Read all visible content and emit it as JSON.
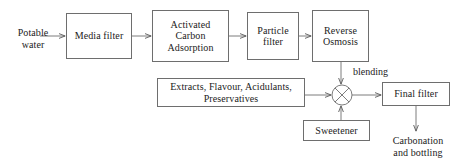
{
  "diagram": {
    "canvas": {
      "width": 460,
      "height": 168,
      "background": "#ffffff"
    },
    "style": {
      "line_color": "#6e6e6e",
      "text_color": "#1b1b1b",
      "box_fill": "#ffffff"
    },
    "nodes": [
      {
        "id": "potable_water",
        "label": "Potable\nwater",
        "label_line1": "Potable",
        "label_line2": "water",
        "shape": "text",
        "x": 6,
        "y": 27,
        "w": 54,
        "h": 26
      },
      {
        "id": "media_filter",
        "label": "Media filter",
        "shape": "rect",
        "x": 66,
        "y": 13,
        "w": 66,
        "h": 46
      },
      {
        "id": "activated_carbon",
        "label": "Activated\nCarbon\nAdsorption",
        "label_line1": "Activated",
        "label_line2": "Carbon",
        "label_line3": "Adsorption",
        "shape": "rect",
        "x": 152,
        "y": 10,
        "w": 77,
        "h": 52
      },
      {
        "id": "particle_filter",
        "label": "Particle\nfilter",
        "label_line1": "Particle",
        "label_line2": "filter",
        "shape": "rect",
        "x": 247,
        "y": 12,
        "w": 52,
        "h": 48
      },
      {
        "id": "reverse_osmosis",
        "label": "Reverse\nOsmosis",
        "label_line1": "Reverse",
        "label_line2": "Osmosis",
        "shape": "rect",
        "x": 312,
        "y": 10,
        "w": 57,
        "h": 52
      },
      {
        "id": "extracts",
        "label": "Extracts, Flavour, Acidulants,\nPreservatives",
        "label_line1": "Extracts, Flavour, Acidulants,",
        "label_line2": "Preservatives",
        "shape": "rect",
        "x": 157,
        "y": 78,
        "w": 148,
        "h": 29
      },
      {
        "id": "mixer",
        "label": "",
        "shape": "circle-cross",
        "cx": 342,
        "cy": 95,
        "r": 10
      },
      {
        "id": "sweetener",
        "label": "Sweetener",
        "shape": "rect",
        "x": 303,
        "y": 120,
        "w": 67,
        "h": 21
      },
      {
        "id": "final_filter",
        "label": "Final filter",
        "shape": "rect",
        "x": 382,
        "y": 82,
        "w": 68,
        "h": 24
      },
      {
        "id": "carbonation",
        "label": "Carbonation\nand bottling",
        "label_line1": "Carbonation",
        "label_line2": "and bottling",
        "shape": "text",
        "x": 382,
        "y": 135,
        "w": 72,
        "h": 26
      }
    ],
    "edges": [
      {
        "from": "potable_water",
        "to": "media_filter",
        "label": "",
        "direction": "right"
      },
      {
        "from": "media_filter",
        "to": "activated_carbon",
        "label": "",
        "direction": "right"
      },
      {
        "from": "activated_carbon",
        "to": "particle_filter",
        "label": "",
        "direction": "right"
      },
      {
        "from": "particle_filter",
        "to": "reverse_osmosis",
        "label": "",
        "direction": "right"
      },
      {
        "from": "reverse_osmosis",
        "to": "mixer",
        "label": "blending",
        "direction": "down"
      },
      {
        "from": "extracts",
        "to": "mixer",
        "label": "",
        "direction": "right"
      },
      {
        "from": "sweetener",
        "to": "mixer",
        "label": "",
        "direction": "up"
      },
      {
        "from": "mixer",
        "to": "final_filter",
        "label": "",
        "direction": "right"
      },
      {
        "from": "final_filter",
        "to": "carbonation",
        "label": "",
        "direction": "down"
      }
    ],
    "edge_labels": [
      {
        "id": "blending",
        "text": "blending",
        "x": 352,
        "y": 66
      }
    ]
  }
}
